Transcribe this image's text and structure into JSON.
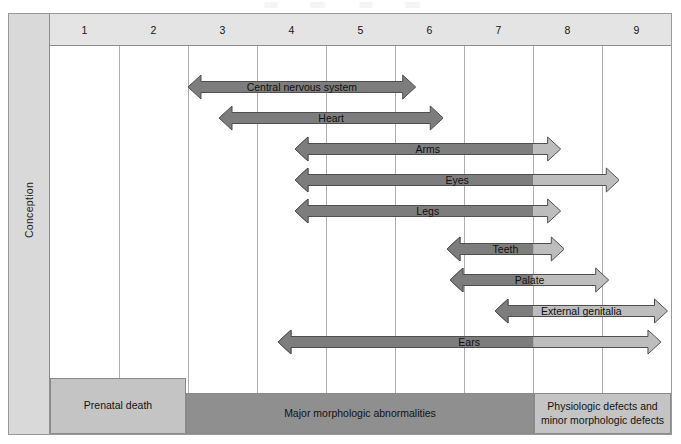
{
  "figure": {
    "axis_label_left": "Conception"
  },
  "header": {
    "weeks": [
      "1",
      "2",
      "3",
      "4",
      "5",
      "6",
      "7",
      "8",
      "9"
    ]
  },
  "bottom_bands": [
    {
      "label": "Prenatal death"
    },
    {
      "label": "Major morphologic abnormalities"
    },
    {
      "label": "Physiologic defects and minor morphologic defects"
    }
  ],
  "colors": {
    "dark_gray": "#7d7d7d",
    "light_gray": "#bdbdbd",
    "band_light": "#c4c4c4",
    "band_dark": "#8f8f8f",
    "header_bg": "#e4e4e4",
    "sidebar_bg": "#d9d9d9",
    "outline": "#4f4f4f"
  },
  "chart_data": {
    "type": "bar",
    "xlabel": "",
    "ylabel": "",
    "xlim": [
      0,
      9
    ],
    "x_unit": "week",
    "grid": true,
    "legend": "none",
    "categories": [
      "Central nervous system",
      "Heart",
      "Arms",
      "Eyes",
      "Legs",
      "Teeth",
      "Palate",
      "External genitalia",
      "Ears"
    ],
    "series": [
      {
        "name": "Highly sensitive period (dark gray)",
        "color": "#7d7d7d",
        "spans": [
          {
            "label": "Central nervous system",
            "start": 2.0,
            "end": 5.3
          },
          {
            "label": "Heart",
            "start": 2.45,
            "end": 5.7
          },
          {
            "label": "Arms",
            "start": 3.55,
            "end": 7.0
          },
          {
            "label": "Eyes",
            "start": 3.55,
            "end": 7.0
          },
          {
            "label": "Legs",
            "start": 3.55,
            "end": 7.0
          },
          {
            "label": "Teeth",
            "start": 5.75,
            "end": 7.0
          },
          {
            "label": "Palate",
            "start": 5.8,
            "end": 7.0
          },
          {
            "label": "External genitalia",
            "start": 6.45,
            "end": 7.0
          },
          {
            "label": "Ears",
            "start": 3.3,
            "end": 7.0
          }
        ]
      },
      {
        "name": "Less sensitive period (light gray)",
        "color": "#bdbdbd",
        "spans": [
          {
            "label": "Arms",
            "start": 7.0,
            "end": 7.4
          },
          {
            "label": "Eyes",
            "start": 7.0,
            "end": 8.25
          },
          {
            "label": "Legs",
            "start": 7.0,
            "end": 7.4
          },
          {
            "label": "Teeth",
            "start": 7.0,
            "end": 7.45
          },
          {
            "label": "Palate",
            "start": 7.0,
            "end": 8.1
          },
          {
            "label": "External genitalia",
            "start": 7.0,
            "end": 8.95
          },
          {
            "label": "Ears",
            "start": 7.0,
            "end": 8.85
          }
        ]
      }
    ],
    "annotations": [
      {
        "text": "Prenatal death",
        "span": [
          0,
          2.0
        ]
      },
      {
        "text": "Major morphologic abnormalities",
        "span": [
          2.0,
          7.0
        ]
      },
      {
        "text": "Physiologic defects and minor morphologic defects",
        "span": [
          7.0,
          9.0
        ]
      }
    ]
  }
}
